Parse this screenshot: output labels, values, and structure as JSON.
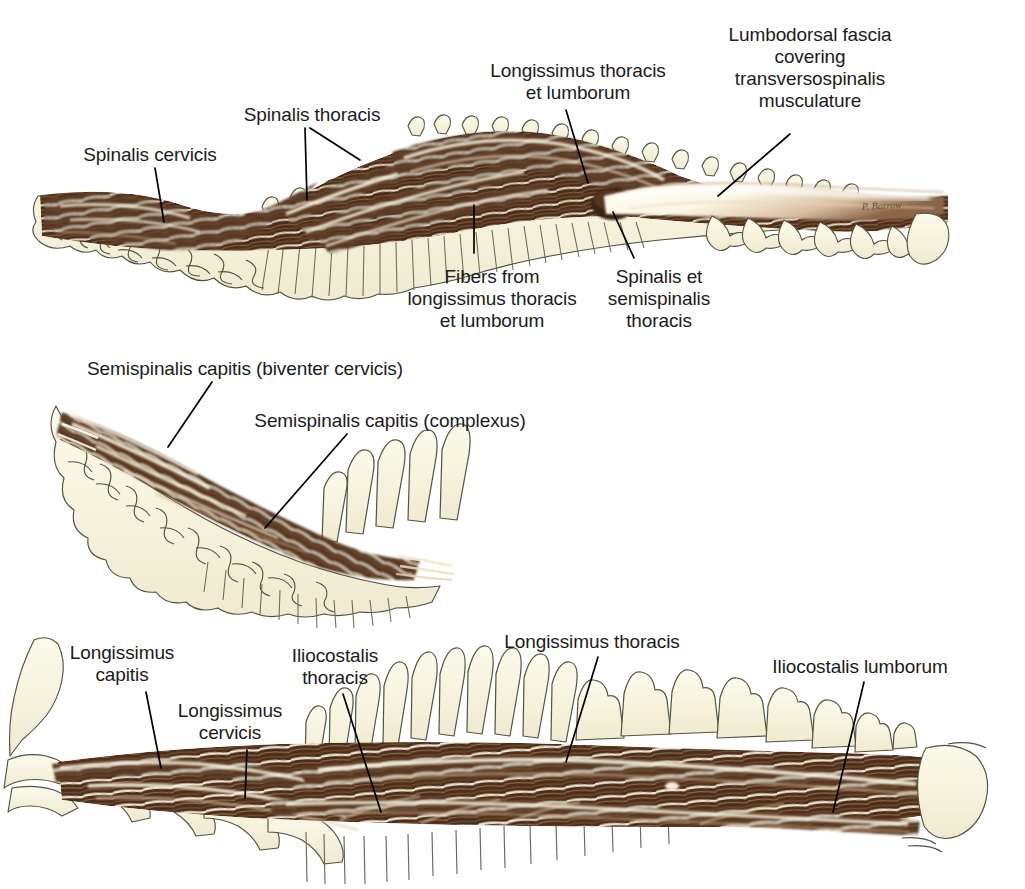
{
  "figure": {
    "background_color": "#ffffff",
    "palette": {
      "muscle_dark": "#54331f",
      "muscle_mid": "#7a5236",
      "muscle_light": "#b9936f",
      "muscle_highlight": "#f7f1de",
      "bone_fill": "#f7f4dc",
      "bone_outline": "#4e5040",
      "fascia_fill": "#fdfaf0",
      "leader_line": "#000000",
      "label_text": "#1b1b1b"
    },
    "signature": "P. Barrow"
  },
  "panels": [
    {
      "id": "panel-top",
      "name": "spinalis-and-longissimus-panel",
      "labels": [
        {
          "key": "spinalis_cervicis",
          "lines": [
            "Spinalis cervicis"
          ],
          "x": 150,
          "y": 144,
          "align": "center",
          "leaders": [
            [
              [
                155,
                168
              ],
              [
                164,
                222
              ]
            ]
          ]
        },
        {
          "key": "spinalis_thoracis",
          "lines": [
            "Spinalis thoracis"
          ],
          "x": 312,
          "y": 104,
          "align": "center",
          "leaders": [
            [
              [
                305,
                128
              ],
              [
                307,
                200
              ]
            ],
            [
              [
                310,
                128
              ],
              [
                360,
                160
              ]
            ]
          ]
        },
        {
          "key": "longissimus_thoracis_et_lumborum",
          "lines": [
            "Longissimus thoracis",
            "et lumborum"
          ],
          "x": 578,
          "y": 60,
          "align": "center",
          "leaders": [
            [
              [
                566,
                110
              ],
              [
                588,
                183
              ]
            ]
          ]
        },
        {
          "key": "lumbodorsal_fascia",
          "lines": [
            "Lumbodorsal fascia",
            "covering",
            "transversospinalis",
            "musculature"
          ],
          "x": 810,
          "y": 24,
          "align": "center",
          "leaders": [
            [
              [
                790,
                134
              ],
              [
                718,
                196
              ]
            ]
          ]
        },
        {
          "key": "fibers_from_longissimus",
          "lines": [
            "Fibers from",
            "longissimus thoracis",
            "et lumborum"
          ],
          "x": 492,
          "y": 266,
          "align": "center",
          "leaders": [
            [
              [
                474,
                253
              ],
              [
                474,
                205
              ]
            ]
          ]
        },
        {
          "key": "spinalis_et_semispinalis_thoracis",
          "lines": [
            "Spinalis et",
            "semispinalis",
            "thoracis"
          ],
          "x": 659,
          "y": 266,
          "align": "center",
          "leaders": [
            [
              [
                634,
                258
              ],
              [
                613,
                212
              ]
            ]
          ]
        }
      ]
    },
    {
      "id": "panel-middle",
      "name": "semispinalis-capitis-panel",
      "labels": [
        {
          "key": "semispinalis_capitis_biventer",
          "lines": [
            "Semispinalis capitis (biventer cervicis)"
          ],
          "x": 245,
          "y": 358,
          "align": "center",
          "leaders": [
            [
              [
                212,
                382
              ],
              [
                168,
                447
              ]
            ]
          ]
        },
        {
          "key": "semispinalis_capitis_complexus",
          "lines": [
            "Semispinalis capitis (complexus)"
          ],
          "x": 390,
          "y": 410,
          "align": "center",
          "leaders": [
            [
              [
                347,
                434
              ],
              [
                265,
                528
              ]
            ]
          ]
        }
      ]
    },
    {
      "id": "panel-bottom",
      "name": "longissimus-and-iliocostalis-panel",
      "labels": [
        {
          "key": "longissimus_capitis",
          "lines": [
            "Longissimus",
            "capitis"
          ],
          "x": 122,
          "y": 642,
          "align": "center",
          "leaders": [
            [
              [
                146,
                692
              ],
              [
                161,
                768
              ]
            ]
          ]
        },
        {
          "key": "longissimus_cervicis",
          "lines": [
            "Longissimus",
            "cervicis"
          ],
          "x": 230,
          "y": 700,
          "align": "center",
          "leaders": [
            [
              [
                247,
                750
              ],
              [
                245,
                798
              ]
            ]
          ]
        },
        {
          "key": "iliocostalis_thoracis",
          "lines": [
            "Iliocostalis",
            "thoracis"
          ],
          "x": 335,
          "y": 645,
          "align": "center",
          "leaders": [
            [
              [
                343,
                694
              ],
              [
                381,
                812
              ]
            ]
          ]
        },
        {
          "key": "longissimus_thoracis",
          "lines": [
            "Longissimus thoracis"
          ],
          "x": 592,
          "y": 631,
          "align": "center",
          "leaders": [
            [
              [
                598,
                657
              ],
              [
                566,
                762
              ]
            ]
          ]
        },
        {
          "key": "iliocostalis_lumborum",
          "lines": [
            "Iliocostalis lumborum"
          ],
          "x": 860,
          "y": 656,
          "align": "center",
          "leaders": [
            [
              [
                864,
                682
              ],
              [
                833,
                812
              ]
            ]
          ]
        }
      ]
    }
  ]
}
